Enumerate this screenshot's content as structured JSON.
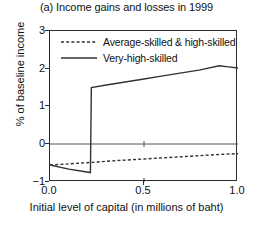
{
  "chart_data": {
    "type": "line",
    "title": "(a) Income gains and losses in 1999",
    "xlabel": "Initial level of capital (in millions of baht)",
    "ylabel": "% of baseline income",
    "xlim": [
      0.0,
      1.0
    ],
    "ylim": [
      -1,
      3
    ],
    "xticks": [
      0.0,
      0.5,
      1.0
    ],
    "xtick_labels": [
      "0.0",
      "0.5",
      "1.0"
    ],
    "yticks": [
      -1,
      0,
      1,
      2,
      3
    ],
    "ytick_labels": [
      "−1",
      "0",
      "1",
      "2",
      "3"
    ],
    "grid": false,
    "zero_line": true,
    "legend_position": "top-left-inside",
    "series": [
      {
        "name": "Average-skilled & high-skilled",
        "style": "dashed",
        "color": "#333333",
        "x": [
          0.0,
          0.1,
          0.22,
          0.3,
          0.4,
          0.5,
          0.6,
          0.7,
          0.8,
          0.9,
          1.0
        ],
        "values": [
          -0.55,
          -0.52,
          -0.48,
          -0.45,
          -0.42,
          -0.39,
          -0.36,
          -0.33,
          -0.3,
          -0.27,
          -0.25
        ]
      },
      {
        "name": "Very-high-skilled",
        "style": "solid",
        "color": "#333333",
        "x": [
          0.0,
          0.1,
          0.215,
          0.22,
          0.3,
          0.4,
          0.5,
          0.6,
          0.7,
          0.8,
          0.9,
          0.95,
          1.0
        ],
        "values": [
          -0.55,
          -0.66,
          -0.75,
          1.5,
          1.57,
          1.65,
          1.73,
          1.81,
          1.89,
          1.97,
          2.08,
          2.05,
          2.02
        ]
      }
    ],
    "annotations": [
      {
        "label": "discontinuous jump",
        "x": 0.22,
        "from": -0.75,
        "to": 1.5
      }
    ]
  },
  "legend": {
    "items": [
      {
        "label": "Average-skilled & high-skilled",
        "key": "dashed-line-key"
      },
      {
        "label": "Very-high-skilled",
        "key": "solid-line-key"
      }
    ]
  },
  "axes": {
    "y_title": "% of baseline income",
    "x_title": "Initial level of capital (in millions of baht)",
    "y_labels": {
      "t3": "3",
      "t2": "2",
      "t1": "1",
      "t0": "0",
      "tm1": "−1"
    },
    "x_labels": {
      "x0": "0.0",
      "x1": "0.5",
      "x2": "1.0"
    }
  }
}
